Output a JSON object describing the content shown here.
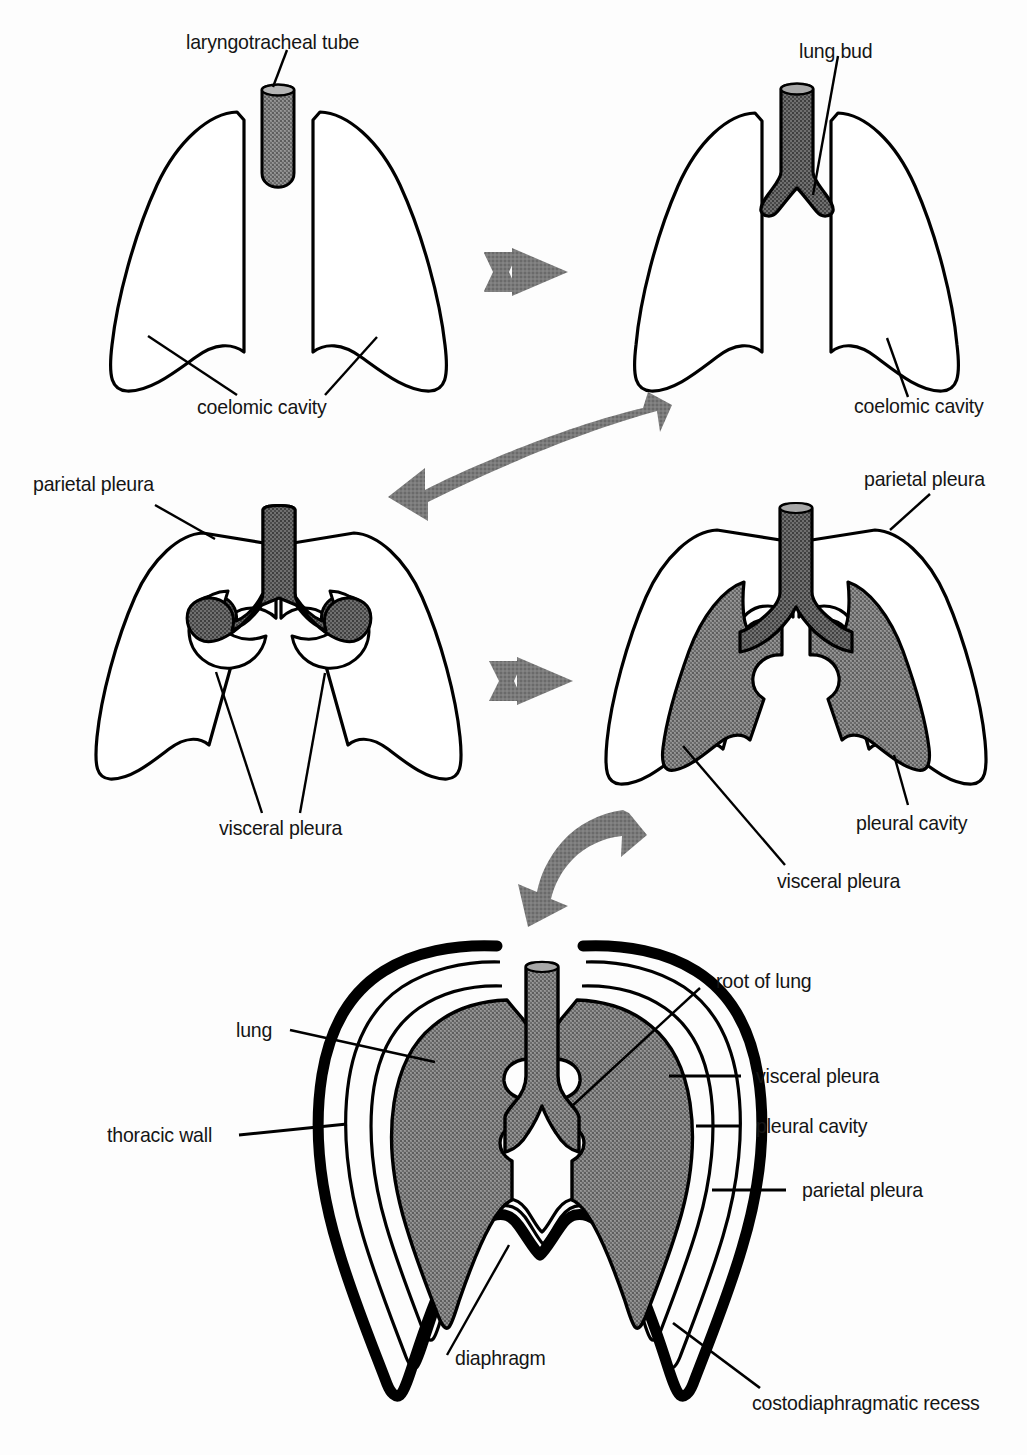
{
  "figure": {
    "colors": {
      "outline": "#000000",
      "lung_fill": "#7d7d7d",
      "tube_fill": "#6e6e6e",
      "arrow_gray": "#737373",
      "background": "#ffffff",
      "text": "#151515"
    },
    "artist_signature": "vmc"
  },
  "panels": [
    {
      "id": "panel-1",
      "name": "stage-1-laryngotracheal-tube",
      "labels": [
        {
          "name": "laryngotracheal-tube",
          "text": "laryngotracheal tube"
        },
        {
          "name": "coelomic-cavity",
          "text": "coelomic cavity"
        }
      ]
    },
    {
      "id": "panel-2",
      "name": "stage-2-lung-bud",
      "labels": [
        {
          "name": "lung-bud",
          "text": "lung bud"
        },
        {
          "name": "coelomic-cavity",
          "text": "coelomic cavity"
        }
      ]
    },
    {
      "id": "panel-3",
      "name": "stage-3-pleura-forming",
      "labels": [
        {
          "name": "parietal-pleura",
          "text": "parietal pleura"
        },
        {
          "name": "visceral-pleura",
          "text": "visceral pleura"
        }
      ]
    },
    {
      "id": "panel-4",
      "name": "stage-4-pleural-cavity",
      "labels": [
        {
          "name": "parietal-pleura",
          "text": "parietal pleura"
        },
        {
          "name": "pleural-cavity",
          "text": "pleural cavity"
        },
        {
          "name": "visceral-pleura",
          "text": "visceral pleura"
        }
      ]
    },
    {
      "id": "panel-5",
      "name": "stage-5-mature-thorax",
      "labels": [
        {
          "name": "root-of-lung",
          "text": "root of lung"
        },
        {
          "name": "visceral-pleura",
          "text": "visceral pleura"
        },
        {
          "name": "pleural-cavity",
          "text": "pleural cavity"
        },
        {
          "name": "parietal-pleura",
          "text": "parietal pleura"
        },
        {
          "name": "lung",
          "text": "lung"
        },
        {
          "name": "thoracic-wall",
          "text": "thoracic wall"
        },
        {
          "name": "diaphragm",
          "text": "diaphragm"
        },
        {
          "name": "costodiaphragmatic-recess",
          "text": "costodiaphragmatic recess"
        }
      ]
    }
  ],
  "arrows": [
    {
      "name": "arrow-panel1-to-panel2",
      "style": "straight-right"
    },
    {
      "name": "arrow-panel2-to-panel3",
      "style": "curved-left-down"
    },
    {
      "name": "arrow-panel3-to-panel4",
      "style": "straight-right"
    },
    {
      "name": "arrow-panel4-to-panel5",
      "style": "curved-down-left"
    }
  ],
  "labels_text": {
    "laryngotracheal_tube": "laryngotracheal tube",
    "lung_bud": "lung bud",
    "coelomic_cavity_left": "coelomic cavity",
    "coelomic_cavity_right": "coelomic cavity",
    "parietal_pleura_mid_left": "parietal pleura",
    "visceral_pleura_mid_left": "visceral pleura",
    "parietal_pleura_mid_right": "parietal pleura",
    "pleural_cavity_mid_right": "pleural cavity",
    "visceral_pleura_mid_right": "visceral pleura",
    "root_of_lung": "root of lung",
    "visceral_pleura_bottom": "visceral pleura",
    "pleural_cavity_bottom": "pleural cavity",
    "parietal_pleura_bottom": "parietal pleura",
    "lung": "lung",
    "thoracic_wall": "thoracic wall",
    "diaphragm": "diaphragm",
    "costodiaphragmatic_recess": "costodiaphragmatic recess",
    "signature": "vmc"
  }
}
